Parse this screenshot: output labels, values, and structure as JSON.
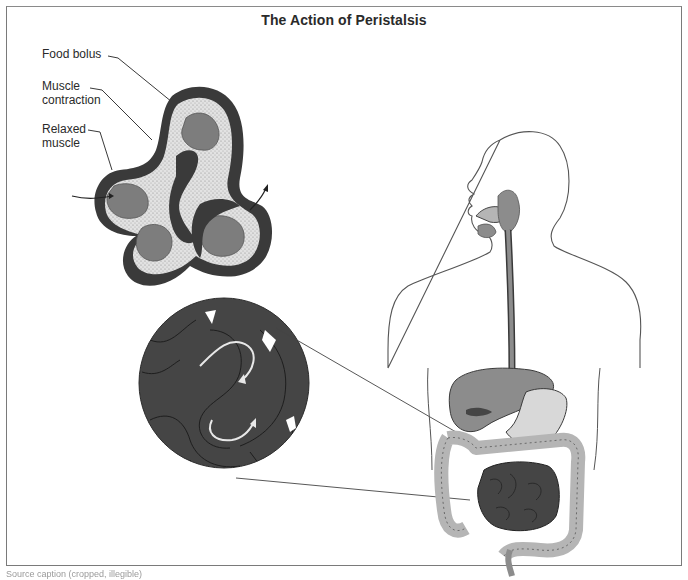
{
  "figure": {
    "title": "The Action of Peristalsis",
    "labels": {
      "food_bolus": "Food bolus",
      "muscle_contraction_line1": "Muscle",
      "muscle_contraction_line2": "contraction",
      "relaxed_muscle_line1": "Relaxed",
      "relaxed_muscle_line2": "muscle"
    },
    "panels": [
      {
        "name": "peristalsis-cross-section",
        "description": "Cutaway of intestine showing food boluses moved by muscle contraction"
      },
      {
        "name": "magnified-intestine-circle",
        "description": "Magnified view of small intestine loops with flow arrows"
      },
      {
        "name": "human-torso-digestive-system",
        "description": "Outline of human torso with mouth, esophagus, stomach, liver and intestines"
      }
    ],
    "caption": "Source caption (cropped, illegible)",
    "colors": {
      "dark_muscle": "#3a3a3a",
      "bolus": "#7d7d7d",
      "lumen": "#c8c8c8",
      "intestine_dark": "#454545",
      "organ_mid": "#8c8c8c",
      "organ_light": "#b5b5b5",
      "outline": "#555555"
    }
  }
}
